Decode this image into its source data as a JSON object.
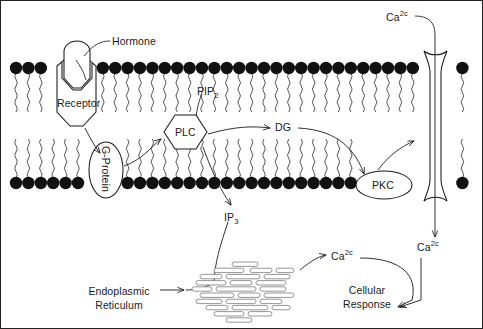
{
  "diagram": {
    "membrane": {
      "head_color": "#111111",
      "upper_leaflet_y": 68,
      "lower_leaflet_y": 183,
      "head_radius": 6.2
    },
    "labels": {
      "hormone": "Hormone",
      "receptor": "Receptor",
      "g_protein": "G-Protein",
      "plc": "PLC",
      "pip2_text": "PIP",
      "pip2_sub": "2",
      "dg": "DG",
      "ip3_text": "IP",
      "ip3_sub": "3",
      "pkc": "PKC",
      "calcium_text": "Ca",
      "calcium_sup": "2c",
      "er_line1": "Endoplasmic",
      "er_line2": "Reticulum",
      "response_line1": "Cellular",
      "response_line2": "Response"
    },
    "nodes": [
      {
        "name": "hormone",
        "label": "Hormone",
        "shape": "dome"
      },
      {
        "name": "receptor",
        "label": "Receptor",
        "shape": "hexagon-tall"
      },
      {
        "name": "g-protein",
        "label": "G-Protein",
        "shape": "ellipse-vertical"
      },
      {
        "name": "plc",
        "label": "PLC",
        "shape": "hexagon"
      },
      {
        "name": "pip2",
        "label": "PIP2",
        "shape": "leader-label"
      },
      {
        "name": "dg",
        "label": "DG",
        "shape": "text"
      },
      {
        "name": "ip3",
        "label": "IP3",
        "shape": "text"
      },
      {
        "name": "pkc",
        "label": "PKC",
        "shape": "ellipse"
      },
      {
        "name": "calcium-channel",
        "label": "Ca2+ channel",
        "shape": "hourglass"
      },
      {
        "name": "endoplasmic-reticulum",
        "label": "Endoplasmic Reticulum",
        "shape": "cisternae-stack"
      },
      {
        "name": "cellular-response",
        "label": "Cellular Response",
        "shape": "text"
      }
    ],
    "colors": {
      "stroke": "#1a1a1a",
      "lipid_head": "#111111",
      "er_fill": "#ffffff",
      "er_stroke": "#7a7a7a",
      "background": "#ffffff"
    }
  }
}
